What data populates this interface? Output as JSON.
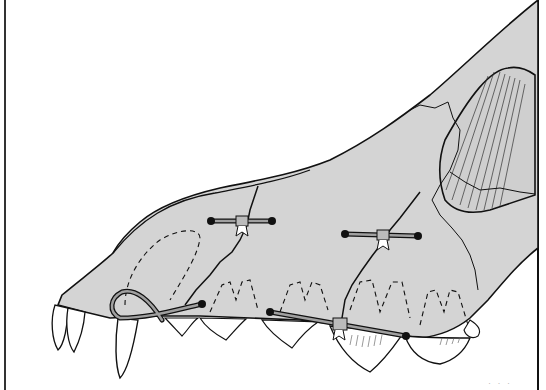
{
  "illustration": {
    "subject": "Canine skull, left lateral view, with interfragmentary wire fixation of maxillary fractures",
    "colors": {
      "background": "#ffffff",
      "bone_fill": "#d4d4d4",
      "line": "#111111",
      "tooth_fill": "#ffffff",
      "wire": "#9a9a9a"
    },
    "wires": [
      {
        "name": "dorsal-nasal-wire",
        "ends": [
          [
            211,
            221
          ],
          [
            272,
            221
          ]
        ]
      },
      {
        "name": "mid-maxillary-wire",
        "ends": [
          [
            345,
            234
          ],
          [
            418,
            236
          ]
        ]
      },
      {
        "name": "rostral-canine-loop-wire",
        "ends": [
          [
            115,
            320
          ],
          [
            202,
            304
          ]
        ]
      },
      {
        "name": "ventral-alveolar-wire",
        "ends": [
          [
            270,
            312
          ],
          [
            406,
            336
          ]
        ]
      }
    ],
    "signature": "· · ·"
  }
}
